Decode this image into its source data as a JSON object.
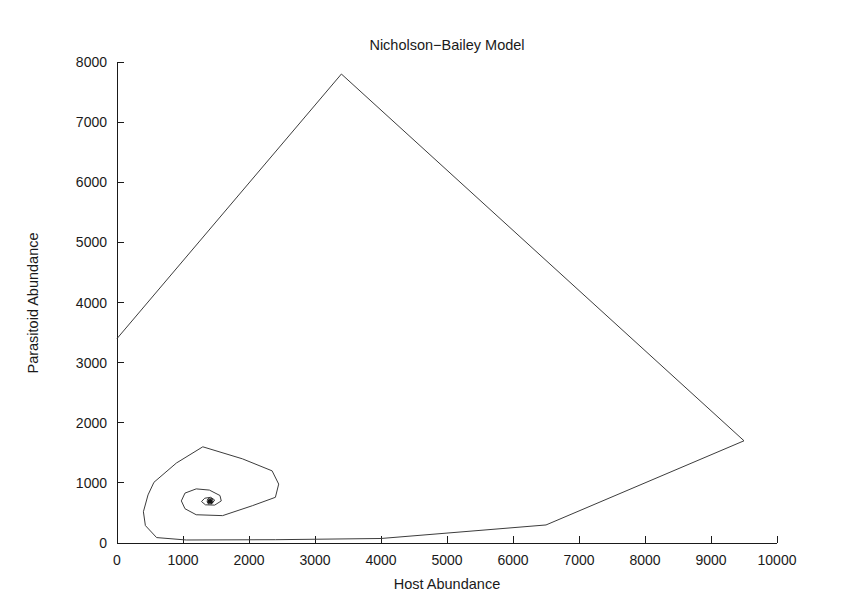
{
  "chart_data": {
    "type": "line",
    "title": "Nicholson−Bailey Model",
    "xlabel": "Host Abundance",
    "ylabel": "Parasitoid Abundance",
    "xlim": [
      0,
      10000
    ],
    "ylim": [
      0,
      8000
    ],
    "grid": false,
    "legend": null,
    "x_ticks": [
      0,
      1000,
      2000,
      3000,
      4000,
      5000,
      6000,
      7000,
      8000,
      9000,
      10000
    ],
    "y_ticks": [
      0,
      1000,
      2000,
      3000,
      4000,
      5000,
      6000,
      7000,
      8000
    ],
    "x_tick_labels": [
      "0",
      "1000",
      "2000",
      "3000",
      "4000",
      "5000",
      "6000",
      "7000",
      "8000",
      "9000",
      "10000"
    ],
    "y_tick_labels": [
      "0",
      "1000",
      "2000",
      "3000",
      "4000",
      "5000",
      "6000",
      "7000",
      "8000"
    ],
    "line_color": "#3c3c3c",
    "axis_color": "#1a1a1a",
    "background_color": "#ffffff",
    "series": [
      {
        "name": "host-parasitoid trajectory",
        "description": "Phase-plane orbit spiralling inward to the coexistence equilibrium",
        "points": [
          [
            0,
            3400
          ],
          [
            3400,
            7800
          ],
          [
            9500,
            1700
          ],
          [
            6500,
            300
          ],
          [
            4000,
            75
          ],
          [
            2400,
            55
          ],
          [
            1050,
            50
          ],
          [
            600,
            90
          ],
          [
            430,
            290
          ],
          [
            400,
            520
          ],
          [
            470,
            800
          ],
          [
            560,
            1010
          ],
          [
            900,
            1330
          ],
          [
            1300,
            1600
          ],
          [
            1900,
            1400
          ],
          [
            2350,
            1200
          ],
          [
            2450,
            980
          ],
          [
            2400,
            760
          ],
          [
            2050,
            620
          ],
          [
            1600,
            455
          ],
          [
            1200,
            470
          ],
          [
            1030,
            570
          ],
          [
            975,
            700
          ],
          [
            1030,
            830
          ],
          [
            1200,
            900
          ],
          [
            1400,
            880
          ],
          [
            1560,
            790
          ],
          [
            1580,
            700
          ],
          [
            1480,
            630
          ],
          [
            1340,
            635
          ],
          [
            1280,
            690
          ],
          [
            1330,
            745
          ],
          [
            1420,
            760
          ],
          [
            1480,
            715
          ],
          [
            1450,
            670
          ],
          [
            1390,
            672
          ],
          [
            1380,
            705
          ],
          [
            1420,
            718
          ],
          [
            1440,
            698
          ],
          [
            1415,
            685
          ],
          [
            1398,
            695
          ],
          [
            1410,
            703
          ],
          [
            1420,
            696
          ],
          [
            1410,
            691
          ],
          [
            1405,
            695
          ]
        ]
      }
    ],
    "equilibrium_point": {
      "label": "equilibrium",
      "x": 1410,
      "y": 695,
      "marker": "asterisk-cluster"
    }
  }
}
